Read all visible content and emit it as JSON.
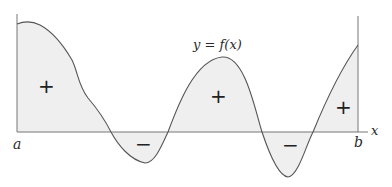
{
  "diagram": {
    "type": "signed-area-under-curve",
    "curve_label": "y = f(x)",
    "x_axis_label": "x",
    "interval_start_label": "a",
    "interval_end_label": "b",
    "regions": [
      {
        "sign": "+",
        "position": "left hump"
      },
      {
        "sign": "−",
        "position": "first dip"
      },
      {
        "sign": "+",
        "position": "middle hump"
      },
      {
        "sign": "−",
        "position": "second dip"
      },
      {
        "sign": "+",
        "position": "right rise"
      }
    ],
    "colors": {
      "fill": "#f0f0f0",
      "curve": "#555555",
      "axis": "#777777"
    }
  }
}
